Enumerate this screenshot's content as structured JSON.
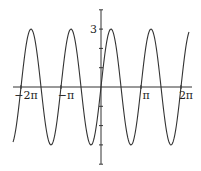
{
  "chart_data": {
    "type": "line",
    "title": "",
    "xlabel": "",
    "ylabel": "",
    "function": "y = 3 sin(2x)",
    "series": [
      {
        "name": "3sin(2x)",
        "amplitude": 3,
        "frequency": 2,
        "phase": 0,
        "color": "#333333"
      }
    ],
    "x_domain": [
      -6.91,
      6.91
    ],
    "xlim": [
      -6.91,
      6.91
    ],
    "ylim": [
      -4,
      4
    ],
    "x_ticks": [
      {
        "value": -6.2832,
        "label": "−2π"
      },
      {
        "value": -3.1416,
        "label": "−π"
      },
      {
        "value": 3.1416,
        "label": "π"
      },
      {
        "value": 6.2832,
        "label": "2π"
      }
    ],
    "y_ticks": [
      {
        "value": -4,
        "label": ""
      },
      {
        "value": -3,
        "label": ""
      },
      {
        "value": -2,
        "label": ""
      },
      {
        "value": -1,
        "label": ""
      },
      {
        "value": 1,
        "label": ""
      },
      {
        "value": 2,
        "label": ""
      },
      {
        "value": 3,
        "label": "3"
      },
      {
        "value": 4,
        "label": ""
      }
    ],
    "grid": false,
    "legend": "none"
  }
}
